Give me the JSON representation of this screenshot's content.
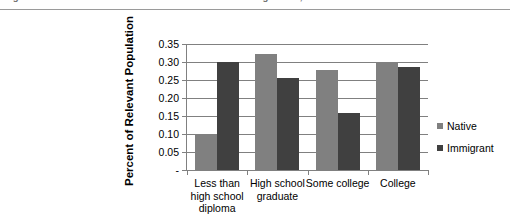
{
  "top_caption": {
    "text": "Figure 5. Educational Attainment of the Native and Foreign Born, 2009"
  },
  "legend": {
    "position": "right",
    "entries": [
      {
        "label": "Native",
        "color": "#808080",
        "swatch": "square-swatch-icon"
      },
      {
        "label": "Immigrant",
        "color": "#404040",
        "swatch": "square-swatch-icon"
      }
    ]
  },
  "axes": {
    "y_title": "Percent of Relevant Population",
    "y_tick_labels": [
      "0.35",
      "0.30",
      "0.25",
      "0.20",
      "0.15",
      "0.10",
      "0.05",
      "-"
    ],
    "x_tick_labels": [
      "Less than high school diploma",
      "High school graduate",
      "Some college",
      "College"
    ]
  },
  "chart_data": {
    "type": "bar",
    "title": "",
    "subtitle": "",
    "xlabel": "",
    "ylabel": "Percent of Relevant Population",
    "categories": [
      "Less than high school diploma",
      "High school graduate",
      "Some college",
      "College"
    ],
    "series": [
      {
        "name": "Native",
        "color": "#808080",
        "values": [
          0.097,
          0.322,
          0.278,
          0.299
        ]
      },
      {
        "name": "Immigrant",
        "color": "#404040",
        "values": [
          0.3,
          0.255,
          0.157,
          0.287
        ]
      }
    ],
    "ylim": [
      0,
      0.35
    ],
    "ytick_values": [
      0.35,
      0.3,
      0.25,
      0.2,
      0.15,
      0.1,
      0.05,
      0
    ],
    "ytick_labels": [
      "0.35",
      "0.30",
      "0.25",
      "0.20",
      "0.15",
      "0.10",
      "0.05",
      "-"
    ],
    "grid": true,
    "grid_axis": "y",
    "legend_position": "right",
    "bar_mode": "grouped"
  },
  "colors": {
    "native": "#808080",
    "immigrant": "#404040",
    "axis": "#808080",
    "grid": "#808080",
    "text": "#000000",
    "caption": "#6e6e6e",
    "rule": "#9a9a9a",
    "background": "#ffffff"
  }
}
